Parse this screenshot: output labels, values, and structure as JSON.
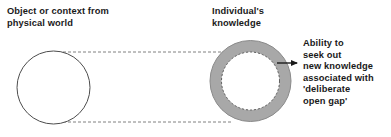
{
  "canvas": {
    "width": 391,
    "height": 137,
    "background": "#ffffff"
  },
  "labels": {
    "physical_world": "Object or context from\nphysical world",
    "individual_knowledge": "Individual's\nknowledge",
    "ability_seek": "Ability to\nseek out\nnew knowledge\nassociated with\n'deliberate\nopen gap'"
  },
  "shapes": {
    "source_circle": {
      "name": "Object or context from physical world",
      "cx": 53.5,
      "cy": 87.5,
      "r": 36.5,
      "fill": "#ffffff",
      "stroke": "#4d4d4d",
      "stroke_width": 1
    },
    "knowledge_ring": {
      "name": "Individual's knowledge",
      "cx": 250.5,
      "cy": 81,
      "outer_r": 40.5,
      "inner_r": 29,
      "fill": "#a8a8a8",
      "stroke": "#808080",
      "inner_fill": "#ffffff",
      "inner_stroke_dash": "2,2",
      "inner_stroke": "#595959"
    },
    "connector_top": {
      "name": "dashed tangent upper",
      "x1": 53,
      "y1": 52,
      "x2": 231,
      "y2": 52,
      "stroke": "#808080",
      "dash": "3,2"
    },
    "connector_bottom": {
      "name": "dashed tangent lower",
      "x1": 53,
      "y1": 122,
      "x2": 231,
      "y2": 122,
      "stroke": "#808080",
      "dash": "3,2"
    },
    "arrow": {
      "name": "arrow to ability text",
      "x1": 277,
      "y1": 63,
      "x2": 299,
      "y2": 63,
      "stroke": "#1a1a1a",
      "stroke_width": 1.4
    }
  },
  "colors": {
    "ring_gray": "#a8a8a8",
    "outline_gray": "#808080",
    "text": "#1a1a1a",
    "white": "#ffffff"
  }
}
